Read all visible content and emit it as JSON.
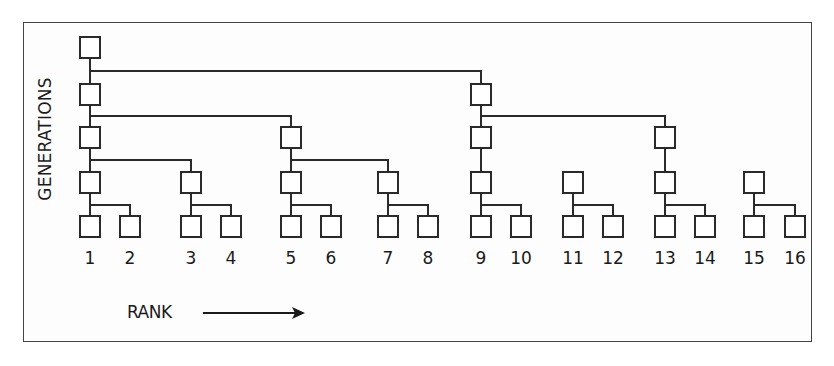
{
  "diagram": {
    "y_axis_label": "GENERATIONS",
    "x_axis_label": "RANK",
    "x_axis_arrow": "right-arrow",
    "colors": {
      "stroke": "#2a2a2a",
      "frame": "#444444",
      "background": "#ffffff"
    },
    "box_size": [
      20,
      21
    ],
    "generation_rows_y": [
      37,
      84,
      127,
      172,
      216
    ],
    "columns": [
      {
        "rank": "1",
        "x": 80
      },
      {
        "rank": "2",
        "x": 120
      },
      {
        "rank": "3",
        "x": 181
      },
      {
        "rank": "4",
        "x": 221
      },
      {
        "rank": "5",
        "x": 281
      },
      {
        "rank": "6",
        "x": 321
      },
      {
        "rank": "7",
        "x": 378
      },
      {
        "rank": "8",
        "x": 418
      },
      {
        "rank": "9",
        "x": 471
      },
      {
        "rank": "10",
        "x": 511
      },
      {
        "rank": "11",
        "x": 563
      },
      {
        "rank": "12",
        "x": 603
      },
      {
        "rank": "13",
        "x": 655
      },
      {
        "rank": "14",
        "x": 695
      },
      {
        "rank": "15",
        "x": 744
      },
      {
        "rank": "16",
        "x": 785
      }
    ],
    "nodes": [
      {
        "col": 1,
        "gen": 1
      },
      {
        "col": 1,
        "gen": 2
      },
      {
        "col": 9,
        "gen": 2
      },
      {
        "col": 1,
        "gen": 3
      },
      {
        "col": 5,
        "gen": 3
      },
      {
        "col": 9,
        "gen": 3
      },
      {
        "col": 13,
        "gen": 3
      },
      {
        "col": 1,
        "gen": 4
      },
      {
        "col": 3,
        "gen": 4
      },
      {
        "col": 5,
        "gen": 4
      },
      {
        "col": 7,
        "gen": 4
      },
      {
        "col": 9,
        "gen": 4
      },
      {
        "col": 11,
        "gen": 4
      },
      {
        "col": 13,
        "gen": 4
      },
      {
        "col": 15,
        "gen": 4
      },
      {
        "col": 1,
        "gen": 5
      },
      {
        "col": 2,
        "gen": 5
      },
      {
        "col": 3,
        "gen": 5
      },
      {
        "col": 4,
        "gen": 5
      },
      {
        "col": 5,
        "gen": 5
      },
      {
        "col": 6,
        "gen": 5
      },
      {
        "col": 7,
        "gen": 5
      },
      {
        "col": 8,
        "gen": 5
      },
      {
        "col": 9,
        "gen": 5
      },
      {
        "col": 10,
        "gen": 5
      },
      {
        "col": 11,
        "gen": 5
      },
      {
        "col": 12,
        "gen": 5
      },
      {
        "col": 13,
        "gen": 5
      },
      {
        "col": 14,
        "gen": 5
      },
      {
        "col": 15,
        "gen": 5
      },
      {
        "col": 16,
        "gen": 5
      }
    ],
    "edges": [
      {
        "from": [
          1,
          1
        ],
        "to": [
          1,
          2
        ]
      },
      {
        "from": [
          1,
          1
        ],
        "to": [
          9,
          2
        ]
      },
      {
        "from": [
          1,
          2
        ],
        "to": [
          1,
          3
        ]
      },
      {
        "from": [
          1,
          2
        ],
        "to": [
          5,
          3
        ]
      },
      {
        "from": [
          9,
          2
        ],
        "to": [
          9,
          3
        ]
      },
      {
        "from": [
          9,
          2
        ],
        "to": [
          13,
          3
        ]
      },
      {
        "from": [
          1,
          3
        ],
        "to": [
          1,
          4
        ]
      },
      {
        "from": [
          1,
          3
        ],
        "to": [
          3,
          4
        ]
      },
      {
        "from": [
          5,
          3
        ],
        "to": [
          5,
          4
        ]
      },
      {
        "from": [
          5,
          3
        ],
        "to": [
          7,
          4
        ]
      },
      {
        "from": [
          9,
          3
        ],
        "to": [
          9,
          4
        ]
      },
      {
        "from": [
          13,
          3
        ],
        "to": [
          13,
          4
        ]
      },
      {
        "from": [
          1,
          4
        ],
        "to": [
          1,
          5
        ]
      },
      {
        "from": [
          1,
          4
        ],
        "to": [
          2,
          5
        ]
      },
      {
        "from": [
          3,
          4
        ],
        "to": [
          3,
          5
        ]
      },
      {
        "from": [
          3,
          4
        ],
        "to": [
          4,
          5
        ]
      },
      {
        "from": [
          5,
          4
        ],
        "to": [
          5,
          5
        ]
      },
      {
        "from": [
          5,
          4
        ],
        "to": [
          6,
          5
        ]
      },
      {
        "from": [
          7,
          4
        ],
        "to": [
          7,
          5
        ]
      },
      {
        "from": [
          7,
          4
        ],
        "to": [
          8,
          5
        ]
      },
      {
        "from": [
          9,
          4
        ],
        "to": [
          9,
          5
        ]
      },
      {
        "from": [
          9,
          4
        ],
        "to": [
          10,
          5
        ]
      },
      {
        "from": [
          11,
          4
        ],
        "to": [
          11,
          5
        ]
      },
      {
        "from": [
          11,
          4
        ],
        "to": [
          12,
          5
        ]
      },
      {
        "from": [
          13,
          4
        ],
        "to": [
          13,
          5
        ]
      },
      {
        "from": [
          13,
          4
        ],
        "to": [
          14,
          5
        ]
      },
      {
        "from": [
          15,
          4
        ],
        "to": [
          15,
          5
        ]
      },
      {
        "from": [
          15,
          4
        ],
        "to": [
          16,
          5
        ]
      }
    ],
    "rank_labels_y": 258
  }
}
